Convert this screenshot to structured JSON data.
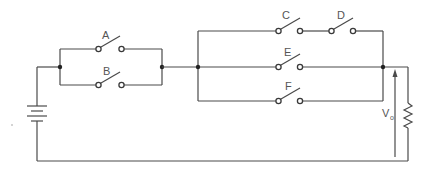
{
  "diagram": {
    "type": "switching circuit",
    "source": "battery",
    "load": "resistor",
    "switches": [
      {
        "id": "A",
        "label": "A",
        "group": "parallel-1"
      },
      {
        "id": "B",
        "label": "B",
        "group": "parallel-1"
      },
      {
        "id": "C",
        "label": "C",
        "group": "parallel-2-branch-top"
      },
      {
        "id": "D",
        "label": "D",
        "group": "parallel-2-branch-top"
      },
      {
        "id": "E",
        "label": "E",
        "group": "parallel-2-branch-mid"
      },
      {
        "id": "F",
        "label": "F",
        "group": "parallel-2-branch-bottom"
      }
    ],
    "output": {
      "label": "V",
      "subscript": "o"
    },
    "colors": {
      "line": "#4a4a4a",
      "background": "#ffffff"
    }
  }
}
